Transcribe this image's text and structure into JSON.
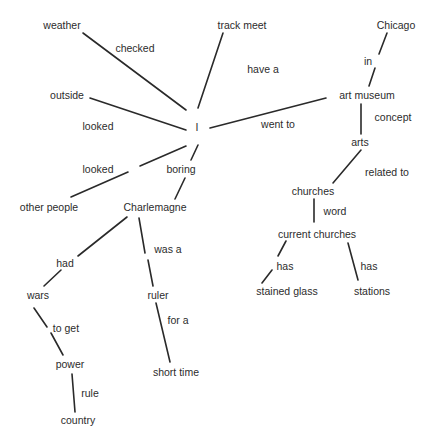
{
  "diagram": {
    "type": "concept-map",
    "line_color": "#2a2a2a",
    "text_color": "#2c2c2c",
    "nodes": {
      "weather": {
        "label": "weather",
        "x": 62,
        "y": 25
      },
      "track_meet": {
        "label": "track meet",
        "x": 242,
        "y": 25
      },
      "chicago": {
        "label": "Chicago",
        "x": 396,
        "y": 25
      },
      "outside": {
        "label": "outside",
        "x": 67,
        "y": 95
      },
      "i": {
        "label": "I",
        "x": 197,
        "y": 127
      },
      "art_museum": {
        "label": "art museum",
        "x": 367,
        "y": 95
      },
      "arts": {
        "label": "arts",
        "x": 360,
        "y": 142
      },
      "other_people": {
        "label": "other people",
        "x": 49,
        "y": 207
      },
      "charlemagne": {
        "label": "Charlemagne",
        "x": 155,
        "y": 207
      },
      "churches": {
        "label": "churches",
        "x": 313,
        "y": 191
      },
      "current_churches": {
        "label": "current churches",
        "x": 317,
        "y": 234
      },
      "stained_glass": {
        "label": "stained glass",
        "x": 287,
        "y": 291
      },
      "stations": {
        "label": "stations",
        "x": 372,
        "y": 291
      },
      "wars": {
        "label": "wars",
        "x": 38,
        "y": 295
      },
      "ruler": {
        "label": "ruler",
        "x": 158,
        "y": 295
      },
      "power": {
        "label": "power",
        "x": 70,
        "y": 364
      },
      "short_time": {
        "label": "short time",
        "x": 176,
        "y": 372
      },
      "country": {
        "label": "country",
        "x": 78,
        "y": 420
      }
    },
    "edge_labels": {
      "checked": {
        "label": "checked",
        "x": 135,
        "y": 48
      },
      "have_a": {
        "label": "have a",
        "x": 263,
        "y": 69
      },
      "in": {
        "label": "in",
        "x": 368,
        "y": 61
      },
      "looked_outside": {
        "label": "looked",
        "x": 98,
        "y": 126
      },
      "went_to": {
        "label": "went to",
        "x": 278,
        "y": 124
      },
      "concept": {
        "label": "concept",
        "x": 393,
        "y": 117
      },
      "looked_people": {
        "label": "looked",
        "x": 98,
        "y": 169
      },
      "boring": {
        "label": "boring",
        "x": 181,
        "y": 169
      },
      "related_to": {
        "label": "related to",
        "x": 387,
        "y": 172
      },
      "word": {
        "label": "word",
        "x": 335,
        "y": 211
      },
      "was_a": {
        "label": "was a",
        "x": 168,
        "y": 249
      },
      "had": {
        "label": "had",
        "x": 65,
        "y": 263
      },
      "has_stained": {
        "label": "has",
        "x": 285,
        "y": 266
      },
      "has_stations": {
        "label": "has",
        "x": 369,
        "y": 266
      },
      "for_a": {
        "label": "for a",
        "x": 178,
        "y": 320
      },
      "to_get": {
        "label": "to get",
        "x": 66,
        "y": 328
      },
      "rule": {
        "label": "rule",
        "x": 90,
        "y": 393
      }
    },
    "edges": [
      {
        "from": "I",
        "relation": "checked",
        "to": "weather",
        "segments": [
          [
            83,
            33,
            186,
            110
          ]
        ]
      },
      {
        "from": "I",
        "relation": "have a",
        "to": "track meet",
        "segments": [
          [
            223,
            33,
            198,
            108
          ]
        ]
      },
      {
        "from": "I",
        "relation": "looked",
        "to": "outside",
        "segments": [
          [
            90,
            98,
            186,
            130
          ]
        ]
      },
      {
        "from": "I",
        "relation": "went to",
        "to": "art museum",
        "segments": [
          [
            210,
            128,
            326,
            98
          ]
        ]
      },
      {
        "from": "art museum",
        "relation": "in",
        "to": "Chicago",
        "segments": [
          [
            387,
            33,
            379,
            54
          ],
          [
            375,
            68,
            369,
            86
          ]
        ]
      },
      {
        "from": "art museum",
        "relation": "concept",
        "to": "arts",
        "segments": [
          [
            361,
            104,
            361,
            134
          ]
        ]
      },
      {
        "from": "I",
        "relation": "looked",
        "to": "other people",
        "segments": [
          [
            186,
            146,
            140,
            166
          ],
          [
            128,
            172,
            71,
            197
          ]
        ]
      },
      {
        "from": "I",
        "relation": "boring",
        "to": "Charlemagne",
        "segments": [
          [
            198,
            145,
            191,
            160
          ],
          [
            185,
            178,
            175,
            199
          ]
        ]
      },
      {
        "from": "arts",
        "relation": "related to",
        "to": "churches",
        "segments": [
          [
            361,
            150,
            333,
            183
          ]
        ]
      },
      {
        "from": "churches",
        "relation": "word",
        "to": "current churches",
        "segments": [
          [
            314,
            199,
            314,
            222
          ]
        ]
      },
      {
        "from": "current churches",
        "relation": "has",
        "to": "stained glass",
        "segments": [
          [
            286,
            241,
            278,
            256
          ],
          [
            272,
            270,
            262,
            283
          ]
        ]
      },
      {
        "from": "current churches",
        "relation": "has",
        "to": "stations",
        "segments": [
          [
            348,
            243,
            358,
            280
          ]
        ]
      },
      {
        "from": "Charlemagne",
        "relation": "had",
        "to": "wars",
        "segments": [
          [
            127,
            217,
            78,
            256
          ],
          [
            61,
            270,
            44,
            286
          ]
        ]
      },
      {
        "from": "Charlemagne",
        "relation": "was a",
        "to": "ruler",
        "segments": [
          [
            139,
            218,
            145,
            253
          ],
          [
            148,
            260,
            153,
            286
          ]
        ]
      },
      {
        "from": "wars",
        "relation": "to get",
        "to": "power",
        "segments": [
          [
            34,
            308,
            47,
            327
          ],
          [
            51,
            333,
            63,
            355
          ]
        ]
      },
      {
        "from": "ruler",
        "relation": "for a",
        "to": "short time",
        "segments": [
          [
            156,
            303,
            170,
            362
          ]
        ]
      },
      {
        "from": "power",
        "relation": "rule",
        "to": "country",
        "segments": [
          [
            72,
            374,
            75,
            412
          ]
        ]
      }
    ]
  }
}
